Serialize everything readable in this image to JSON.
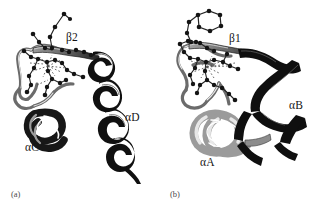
{
  "figure": {
    "width": 333,
    "height": 211,
    "background": "#ffffff",
    "kind": "molecular-ribbon-diagram-pair"
  },
  "panels": [
    {
      "id": "a",
      "caption": "(a)",
      "labels": [
        {
          "name": "beta-strand-2",
          "text": "β2"
        },
        {
          "name": "helix-d",
          "text": "αD"
        },
        {
          "name": "helix-c",
          "text": "αC"
        }
      ]
    },
    {
      "id": "b",
      "caption": "(b)",
      "labels": [
        {
          "name": "beta-strand-1",
          "text": "β1"
        },
        {
          "name": "helix-b",
          "text": "αB"
        },
        {
          "name": "helix-a",
          "text": "αA"
        }
      ]
    }
  ],
  "colors": {
    "background": "#ffffff",
    "ribbon_dark": "#111111",
    "ribbon_mid": "#8f8f8f",
    "ribbon_light": "#d2d2d2",
    "backbone_outline": "#6e6e6e",
    "atom_fill": "#141414",
    "bond_stroke": "#2a2a2a",
    "hbond_stroke": "#555555",
    "label_text": "#141414",
    "caption_text": "#4a4a4a"
  }
}
